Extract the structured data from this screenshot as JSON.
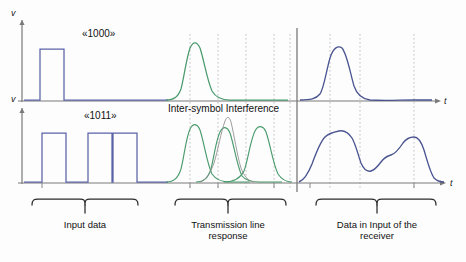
{
  "figure": {
    "title_none": "",
    "axis": {
      "v_label": "v",
      "t_label": "t"
    },
    "rows": [
      {
        "name": "top-row",
        "bit_label": "«1000»",
        "input_pulses": [
          1,
          0,
          0,
          0
        ],
        "line_response": "single-gaussian-pulse",
        "receiver_output": "single-rounded-pulse"
      },
      {
        "name": "bottom-row",
        "bit_label": "«1011»",
        "input_pulses": [
          1,
          0,
          1,
          1
        ],
        "line_response": "three-overlapping-gaussian-pulses-with-sum",
        "receiver_output": "multi-hump-rounded-waveform"
      }
    ],
    "annotation": {
      "isi_label": "Inter-symbol Interference"
    },
    "captions": [
      {
        "id": "input-data",
        "line1": "Input data",
        "line2": ""
      },
      {
        "id": "transmission-line-response",
        "line1": "Transmission line",
        "line2": "response"
      },
      {
        "id": "data-in-input-of-receiver",
        "line1": "Data in Input of the",
        "line2": "receiver"
      }
    ],
    "colors": {
      "input_pulse": "#5b63a8",
      "line_response": "#4b9b6e",
      "receiver": "#4a5490",
      "axis": "#7a7a7a",
      "grid": "#b9b9b9",
      "brace": "#2b2b2b",
      "text": "#111111"
    },
    "grid": {
      "style": "dotted-vertical",
      "symbol_period_marks": 5
    }
  }
}
